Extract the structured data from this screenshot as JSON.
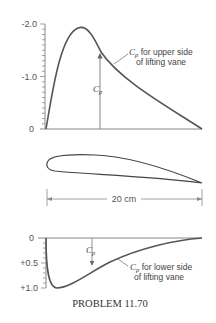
{
  "figure": {
    "caption": "PROBLEM 11.70",
    "upper_plot": {
      "y_ticks": [
        "-2.0",
        "-1.0",
        "0"
      ],
      "curve_label_symbol": "C",
      "curve_label_sub": "p",
      "curve_label_line1": " for upper side",
      "curve_label_line2": "of lifting vane",
      "arrow_label_symbol": "C",
      "arrow_label_sub": "p"
    },
    "airfoil": {
      "dimension_label": "20 cm"
    },
    "lower_plot": {
      "y_ticks": [
        "0",
        "+0.5",
        "+1.0"
      ],
      "curve_label_symbol": "C",
      "curve_label_sub": "p",
      "curve_label_line1": " for lower side",
      "curve_label_line2": "of lifting vane",
      "arrow_label_symbol": "C",
      "arrow_label_sub": "p"
    },
    "colors": {
      "curve": "#555555",
      "axis": "#888888",
      "text": "#444444"
    }
  }
}
